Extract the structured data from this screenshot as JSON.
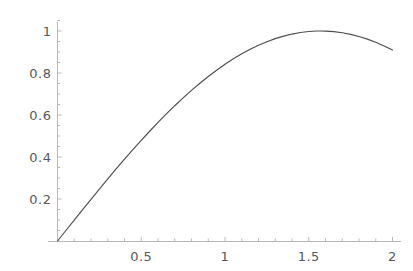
{
  "chart_data": {
    "type": "line",
    "title": "",
    "subtitle": "",
    "xlabel": "",
    "ylabel": "",
    "function": "sin(x)",
    "xlim": [
      0,
      2.08
    ],
    "ylim": [
      0,
      1.06
    ],
    "grid": false,
    "legend": null,
    "axis_style": "mathematica-plain",
    "x_ticks_major": [
      0.5,
      1,
      1.5,
      2
    ],
    "x_tick_labels": [
      "0.5",
      "1",
      "1.5",
      "2"
    ],
    "y_ticks_major": [
      0.2,
      0.4,
      0.6,
      0.8,
      1
    ],
    "y_tick_labels": [
      "0.2",
      "0.4",
      "0.6",
      "0.8",
      "1"
    ],
    "x_minor_tick_step": 0.1,
    "y_minor_tick_step": 0.05,
    "series": [
      {
        "name": "sin(x)",
        "color": "#4d4d4f",
        "x": [
          0,
          0.05,
          0.1,
          0.15,
          0.2,
          0.25,
          0.3,
          0.35,
          0.4,
          0.45,
          0.5,
          0.55,
          0.6,
          0.65,
          0.7,
          0.75,
          0.8,
          0.85,
          0.9,
          0.95,
          1.0,
          1.05,
          1.1,
          1.15,
          1.2,
          1.25,
          1.3,
          1.35,
          1.4,
          1.45,
          1.5,
          1.55,
          1.5708,
          1.6,
          1.65,
          1.7,
          1.75,
          1.8,
          1.85,
          1.9,
          1.95,
          2.0
        ],
        "y": [
          0,
          0.04998,
          0.09983,
          0.14944,
          0.19867,
          0.2474,
          0.29552,
          0.3429,
          0.38942,
          0.43497,
          0.47943,
          0.52269,
          0.56464,
          0.60519,
          0.64422,
          0.68164,
          0.71736,
          0.75128,
          0.78333,
          0.81342,
          0.84147,
          0.86742,
          0.89121,
          0.91276,
          0.93204,
          0.94898,
          0.96356,
          0.97572,
          0.98545,
          0.99271,
          0.99749,
          0.99978,
          1.0,
          0.99957,
          0.99687,
          0.99166,
          0.98399,
          0.97385,
          0.96128,
          0.9463,
          0.92896,
          0.9093
        ]
      }
    ],
    "peak": {
      "x": 1.5708,
      "y": 1.0
    },
    "endpoint": {
      "x": 2.0,
      "y": 0.909
    }
  },
  "axes": {
    "x_axis_color": "#b9b9bb",
    "y_axis_color": "#b9b9bb",
    "tick_color": "#b9b9bb",
    "label_color": "#58585a"
  },
  "canvas": {
    "background": "#ffffff",
    "width": 413,
    "height": 271
  }
}
